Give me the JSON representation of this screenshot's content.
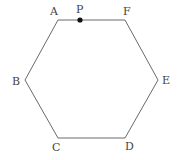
{
  "figure": {
    "shape": "regular hexagon",
    "stroke_color": "#6a6a6a",
    "point_color": "#111111",
    "vertices": [
      {
        "label": "A",
        "x": 58,
        "y": 20,
        "label_x": 50,
        "label_y": 15
      },
      {
        "label": "B",
        "x": 25,
        "y": 80,
        "label_x": 12,
        "label_y": 85
      },
      {
        "label": "C",
        "x": 58,
        "y": 138,
        "label_x": 52,
        "label_y": 151
      },
      {
        "label": "D",
        "x": 125,
        "y": 138,
        "label_x": 125,
        "label_y": 150
      },
      {
        "label": "E",
        "x": 158,
        "y": 80,
        "label_x": 162,
        "label_y": 84
      },
      {
        "label": "F",
        "x": 125,
        "y": 20,
        "label_x": 123,
        "label_y": 15
      }
    ],
    "point": {
      "label": "P",
      "x": 80,
      "y": 20,
      "label_x": 76,
      "label_y": 13,
      "on_segment": "AF"
    }
  }
}
